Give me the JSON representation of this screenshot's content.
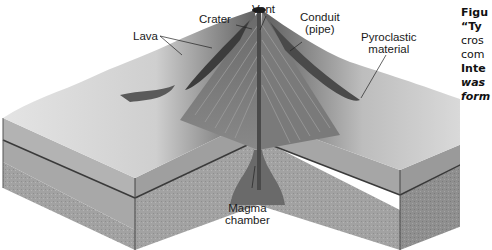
{
  "figure": {
    "labels": {
      "lava": "Lava",
      "crater": "Crater",
      "vent": "Vent",
      "conduit_line1": "Conduit",
      "conduit_line2": "(pipe)",
      "pyroclastic_line1": "Pyroclastic",
      "pyroclastic_line2": "material",
      "magma_line1": "Magma",
      "magma_line2": "chamber"
    }
  },
  "caption": {
    "lines": [
      {
        "text": "Figu",
        "style": "bold"
      },
      {
        "text": "“Ty",
        "style": "bold"
      },
      {
        "text": "cros",
        "style": "regular"
      },
      {
        "text": "com",
        "style": "regular"
      },
      {
        "text": "Inte",
        "style": "bold"
      },
      {
        "text": "was",
        "style": "bold-italic"
      },
      {
        "text": "form",
        "style": "bold-italic"
      }
    ]
  },
  "colors": {
    "background": "#ffffff",
    "text": "#1a1a1a",
    "block_side": "#9a9a9a",
    "block_side_dark": "#7d7d7d",
    "volcano": "#6b6b6b",
    "terrain": "#d9d9d9"
  }
}
